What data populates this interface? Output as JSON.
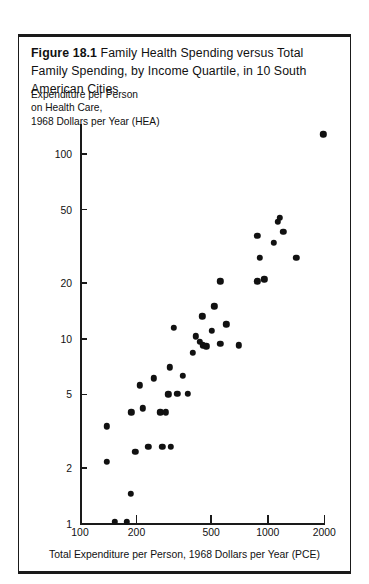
{
  "figure": {
    "number": "Figure 18.1",
    "title": "Family Health Spending versus Total Family Spending, by Income Quartile, in 10 South American Cities"
  },
  "chart_data": {
    "type": "scatter",
    "title": "Family Health Spending versus Total Family Spending, by Income Quartile, in 10 South American Cities",
    "xlabel": "Total Expenditure per Person, 1968 Dollars per Year (PCE)",
    "ylabel": "Expenditure per Person on Health Care, 1968 Dollars per Year (HEA)",
    "ylabel_lines": [
      "Expenditure per Person",
      "on Health Care,",
      "1968 Dollars per Year (HEA)"
    ],
    "xscale": "log",
    "yscale": "log",
    "xlim": [
      100,
      2200
    ],
    "ylim": [
      1,
      170
    ],
    "xticks": [
      100,
      200,
      500,
      1000,
      2000
    ],
    "xticklabels": [
      "100",
      "200",
      "500",
      "1000",
      "2000"
    ],
    "yticks": [
      1,
      2,
      5,
      10,
      20,
      50,
      100
    ],
    "yticklabels": [
      "1",
      "2",
      "5",
      "10",
      "20",
      "50",
      "100"
    ],
    "grid": false,
    "legend": null,
    "marker": "filled-circle",
    "marker_color": "#111111",
    "n_points": 40,
    "points": [
      {
        "x": 153,
        "y": 1.02
      },
      {
        "x": 178,
        "y": 1.02
      },
      {
        "x": 187,
        "y": 1.45
      },
      {
        "x": 139,
        "y": 2.15
      },
      {
        "x": 197,
        "y": 2.45
      },
      {
        "x": 139,
        "y": 3.35
      },
      {
        "x": 231,
        "y": 2.6
      },
      {
        "x": 275,
        "y": 2.6
      },
      {
        "x": 305,
        "y": 2.6
      },
      {
        "x": 188,
        "y": 4.0
      },
      {
        "x": 216,
        "y": 4.2
      },
      {
        "x": 268,
        "y": 4.0
      },
      {
        "x": 286,
        "y": 4.0
      },
      {
        "x": 208,
        "y": 5.6
      },
      {
        "x": 247,
        "y": 6.1
      },
      {
        "x": 296,
        "y": 5.0
      },
      {
        "x": 330,
        "y": 5.05
      },
      {
        "x": 375,
        "y": 5.05
      },
      {
        "x": 300,
        "y": 7.0
      },
      {
        "x": 352,
        "y": 6.3
      },
      {
        "x": 315,
        "y": 11.5
      },
      {
        "x": 398,
        "y": 8.4
      },
      {
        "x": 415,
        "y": 10.3
      },
      {
        "x": 436,
        "y": 9.6
      },
      {
        "x": 452,
        "y": 9.2
      },
      {
        "x": 470,
        "y": 9.1
      },
      {
        "x": 448,
        "y": 13.2
      },
      {
        "x": 505,
        "y": 11.0
      },
      {
        "x": 520,
        "y": 15.0
      },
      {
        "x": 560,
        "y": 9.4
      },
      {
        "x": 600,
        "y": 12.0
      },
      {
        "x": 700,
        "y": 9.2
      },
      {
        "x": 560,
        "y": 20.5
      },
      {
        "x": 880,
        "y": 20.5
      },
      {
        "x": 960,
        "y": 21.0
      },
      {
        "x": 905,
        "y": 27.5
      },
      {
        "x": 880,
        "y": 36.0
      },
      {
        "x": 1080,
        "y": 33.0
      },
      {
        "x": 1130,
        "y": 43.0
      },
      {
        "x": 1160,
        "y": 45.0
      },
      {
        "x": 1210,
        "y": 38.0
      },
      {
        "x": 1420,
        "y": 27.5
      },
      {
        "x": 1980,
        "y": 128.0
      }
    ],
    "axis_calibration": {
      "x_pixel_at_100": 80,
      "x_pixel_at_2000": 324.3,
      "y_pixel_at_1": 523.5,
      "y_pixel_at_100": 154.0
    }
  }
}
